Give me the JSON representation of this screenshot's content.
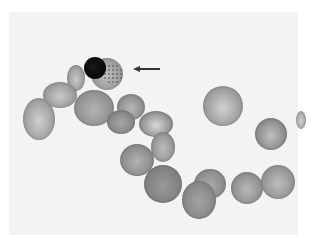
{
  "image": {
    "type": "blood smear micrograph",
    "tone": "grayscale",
    "background_color": "#ffffff",
    "panel_color": "#f3f3f3"
  },
  "annotation": {
    "arrow": {
      "direction": "left",
      "x_start": 160,
      "x_end": 133,
      "y": 69,
      "color": "#333333"
    },
    "target": "nucleated cell with stippled cytoplasm"
  },
  "cells": [
    {
      "id": "lobe-top",
      "cx": 76,
      "cy": 78,
      "rx": 9,
      "ry": 13,
      "shade": "#9a9a9a",
      "center": "#c8c8c8"
    },
    {
      "id": "A",
      "cx": 39,
      "cy": 119,
      "rx": 16,
      "ry": 21,
      "shade": "#9e9e9e",
      "center": "#cfcfcf"
    },
    {
      "id": "B",
      "cx": 60,
      "cy": 95,
      "rx": 17,
      "ry": 13,
      "shade": "#999999",
      "center": "#cacaca"
    },
    {
      "id": "C",
      "cx": 94,
      "cy": 108,
      "rx": 20,
      "ry": 18,
      "shade": "#8f8f8f",
      "center": "#b3b3b3"
    },
    {
      "id": "nucleated",
      "cx": 107,
      "cy": 74,
      "rx": 16,
      "ry": 16,
      "shade": "#9b9b9b",
      "center": "#bdbdbd"
    },
    {
      "id": "F",
      "cx": 131,
      "cy": 107,
      "rx": 14,
      "ry": 13,
      "shade": "#8d8d8d",
      "center": "#b8b8b8"
    },
    {
      "id": "G",
      "cx": 121,
      "cy": 122,
      "rx": 14,
      "ry": 12,
      "shade": "#858585",
      "center": "#a5a5a5"
    },
    {
      "id": "H",
      "cx": 156,
      "cy": 124,
      "rx": 17,
      "ry": 13,
      "shade": "#8e8e8e",
      "center": "#d9d9d9"
    },
    {
      "id": "I",
      "cx": 163,
      "cy": 147,
      "rx": 12,
      "ry": 15,
      "shade": "#939393",
      "center": "#bdbdbd"
    },
    {
      "id": "J",
      "cx": 137,
      "cy": 160,
      "rx": 17,
      "ry": 16,
      "shade": "#8a8a8a",
      "center": "#b2b2b2"
    },
    {
      "id": "K",
      "cx": 163,
      "cy": 184,
      "rx": 19,
      "ry": 19,
      "shade": "#7f7f7f",
      "center": "#999999"
    },
    {
      "id": "L",
      "cx": 210,
      "cy": 184,
      "rx": 16,
      "ry": 15,
      "shade": "#8b8b8b",
      "center": "#a9a9a9"
    },
    {
      "id": "M",
      "cx": 199,
      "cy": 200,
      "rx": 17,
      "ry": 19,
      "shade": "#868686",
      "center": "#a3a3a3"
    },
    {
      "id": "N",
      "cx": 247,
      "cy": 188,
      "rx": 16,
      "ry": 16,
      "shade": "#8e8e8e",
      "center": "#b9b9b9"
    },
    {
      "id": "O",
      "cx": 278,
      "cy": 182,
      "rx": 17,
      "ry": 17,
      "shade": "#939393",
      "center": "#bdbdbd"
    },
    {
      "id": "P",
      "cx": 223,
      "cy": 106,
      "rx": 20,
      "ry": 20,
      "shade": "#9a9a9a",
      "center": "#d2d2d2"
    },
    {
      "id": "Q",
      "cx": 271,
      "cy": 134,
      "rx": 16,
      "ry": 16,
      "shade": "#8a8a8a",
      "center": "#c0c0c0"
    },
    {
      "id": "R-edge",
      "cx": 301,
      "cy": 120,
      "rx": 5,
      "ry": 9,
      "shade": "#aaaaaa",
      "center": "#cccccc"
    }
  ],
  "nucleus": {
    "cx": 95,
    "cy": 68,
    "r": 11
  },
  "stipple": {
    "cx": 113,
    "cy": 74,
    "r": 10
  }
}
